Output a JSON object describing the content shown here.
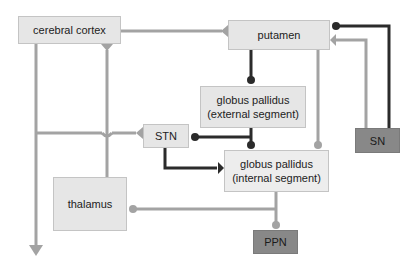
{
  "diagram": {
    "title": "",
    "colors": {
      "excitatory": "#a3a3a3",
      "inhibitory": "#2b2b2b",
      "box_light": "#e6e6e6",
      "box_dark": "#888888"
    },
    "nodes": {
      "cortex": {
        "label": "cerebral cortex"
      },
      "putamen": {
        "label": "putamen"
      },
      "gpe": {
        "line1": "globus pallidus",
        "line2": "(external segment)"
      },
      "stn": {
        "label": "STN"
      },
      "gpi": {
        "line1": "globus pallidus",
        "line2": "(internal segment)"
      },
      "thalamus": {
        "label": "thalamus"
      },
      "sn": {
        "label": "SN"
      },
      "ppn": {
        "label": "PPN"
      }
    },
    "edges": [
      {
        "from": "cerebral cortex",
        "to": "putamen",
        "type": "excitatory"
      },
      {
        "from": "cerebral cortex",
        "to": "output (down)",
        "type": "excitatory"
      },
      {
        "from": "thalamus",
        "to": "cerebral cortex",
        "type": "excitatory"
      },
      {
        "from": "cerebral cortex",
        "to": "STN",
        "type": "excitatory"
      },
      {
        "from": "putamen",
        "to": "globus pallidus (external segment)",
        "type": "inhibitory"
      },
      {
        "from": "putamen",
        "to": "globus pallidus (internal segment)",
        "type": "inhibitory-light"
      },
      {
        "from": "SN",
        "to": "putamen",
        "type": "inhibitory"
      },
      {
        "from": "SN",
        "to": "putamen",
        "type": "excitatory"
      },
      {
        "from": "globus pallidus (external segment)",
        "to": "STN",
        "type": "inhibitory"
      },
      {
        "from": "globus pallidus (external segment)",
        "to": "globus pallidus (internal segment)",
        "type": "inhibitory"
      },
      {
        "from": "STN",
        "to": "globus pallidus (internal segment)",
        "type": "excitatory-dark"
      },
      {
        "from": "globus pallidus (internal segment)",
        "to": "thalamus",
        "type": "inhibitory-light"
      },
      {
        "from": "globus pallidus (internal segment)",
        "to": "PPN",
        "type": "inhibitory-light"
      }
    ]
  }
}
